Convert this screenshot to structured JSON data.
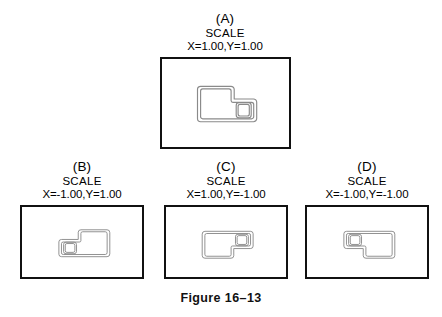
{
  "figure": {
    "caption": "Figure 16–13",
    "panels": [
      {
        "id": "A",
        "letter": "(A)",
        "scale_word": "SCALE",
        "scale_values": "X=1.00,Y=1.00",
        "x_scale": 1.0,
        "y_scale": 1.0,
        "mirror_x": false,
        "mirror_y": false,
        "drawing": "gasket-outline"
      },
      {
        "id": "B",
        "letter": "(B)",
        "scale_word": "SCALE",
        "scale_values": "X=-1.00,Y=1.00",
        "x_scale": -1.0,
        "y_scale": 1.0,
        "mirror_x": true,
        "mirror_y": false,
        "drawing": "gasket-outline"
      },
      {
        "id": "C",
        "letter": "(C)",
        "scale_word": "SCALE",
        "scale_values": "X=1.00,Y=-1.00",
        "x_scale": 1.0,
        "y_scale": -1.0,
        "mirror_x": false,
        "mirror_y": true,
        "drawing": "gasket-outline"
      },
      {
        "id": "D",
        "letter": "(D)",
        "scale_word": "SCALE",
        "scale_values": "X=-1.00,Y=-1.00",
        "x_scale": -1.0,
        "y_scale": -1.0,
        "mirror_x": true,
        "mirror_y": true,
        "drawing": "gasket-outline"
      }
    ]
  },
  "colors": {
    "frame_stroke": "#111111",
    "drawing_stroke": "#8a8a8a",
    "background": "#ffffff",
    "text": "#000000"
  }
}
